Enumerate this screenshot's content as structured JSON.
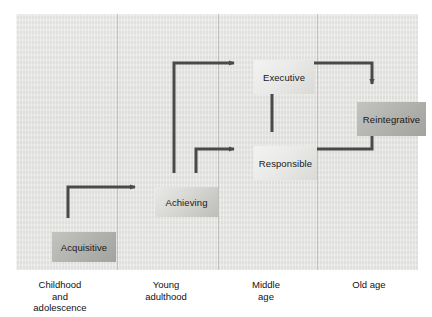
{
  "figure": {
    "background_color": "#e4e4e2",
    "arrow_color": "#4a4a4a"
  },
  "stages": [
    {
      "id": "acquisitive",
      "label": "Acquisitive",
      "column": "childhood",
      "shade": "dark"
    },
    {
      "id": "achieving",
      "label": "Achieving",
      "column": "young",
      "shade": "mid"
    },
    {
      "id": "executive",
      "label": "Executive",
      "column": "middle",
      "shade": "light"
    },
    {
      "id": "responsible",
      "label": "Responsible",
      "column": "middle",
      "shade": "light"
    },
    {
      "id": "reintegrative",
      "label": "Reintegrative",
      "column": "old",
      "shade": "dark"
    }
  ],
  "connections": [
    {
      "from": "acquisitive",
      "to": "achieving",
      "style": "elbow-up-right"
    },
    {
      "from": "achieving",
      "to": "executive",
      "style": "elbow-up-right"
    },
    {
      "from": "achieving",
      "to": "responsible",
      "style": "elbow-up-right"
    },
    {
      "from": "responsible",
      "to": "executive",
      "style": "straight-up"
    },
    {
      "from": "executive",
      "to": "reintegrative",
      "style": "elbow-right-down"
    },
    {
      "from": "responsible",
      "to": "reintegrative",
      "style": "elbow-right-up"
    }
  ],
  "axis": {
    "columns": [
      {
        "id": "childhood",
        "lines": [
          "Childhood",
          "and",
          "adolescence"
        ]
      },
      {
        "id": "young",
        "lines": [
          "Young",
          "adulthood"
        ]
      },
      {
        "id": "middle",
        "lines": [
          "Middle",
          "age"
        ]
      },
      {
        "id": "old",
        "lines": [
          "Old age"
        ]
      }
    ]
  },
  "labels": {
    "childhood_line1": "Childhood",
    "childhood_line2": "and",
    "childhood_line3": "adolescence",
    "young_line1": "Young",
    "young_line2": "adulthood",
    "middle_line1": "Middle",
    "middle_line2": "age",
    "old_line1": "Old age"
  }
}
